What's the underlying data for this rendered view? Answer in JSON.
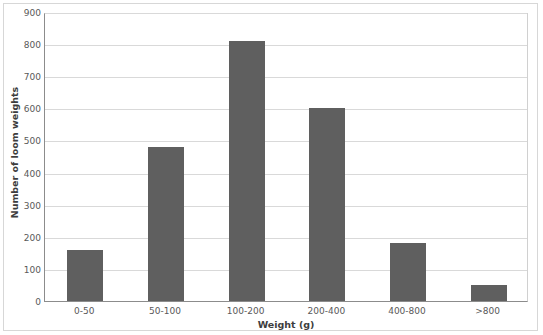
{
  "chart_data": {
    "type": "bar",
    "title": "",
    "categories": [
      "0-50",
      "50-100",
      "100-200",
      "200-400",
      "400-800",
      ">800"
    ],
    "values": [
      160,
      480,
      810,
      600,
      180,
      50
    ],
    "xlabel": "Weight (g)",
    "ylabel": "Number of loom weights",
    "ylim": [
      0,
      900
    ],
    "yticks": [
      0,
      100,
      200,
      300,
      400,
      500,
      600,
      700,
      800,
      900
    ],
    "ytick_labels": [
      "0",
      "100",
      "200",
      "300",
      "400",
      "500",
      "600",
      "700",
      "800",
      "900"
    ],
    "grid": "horizontal",
    "legend": "none",
    "series": [
      {
        "name": "Number of loom weights",
        "values": [
          160,
          480,
          810,
          600,
          180,
          50
        ]
      }
    ]
  },
  "style": {
    "bar_color": "#5f5f5f",
    "gridline_color": "#d9d9d9",
    "axis_color": "#8c8c8c",
    "frame_color": "#d7d7d7",
    "background": "#ffffff",
    "tick_label_color": "#595959",
    "axis_title_color": "#3d3d3d"
  }
}
